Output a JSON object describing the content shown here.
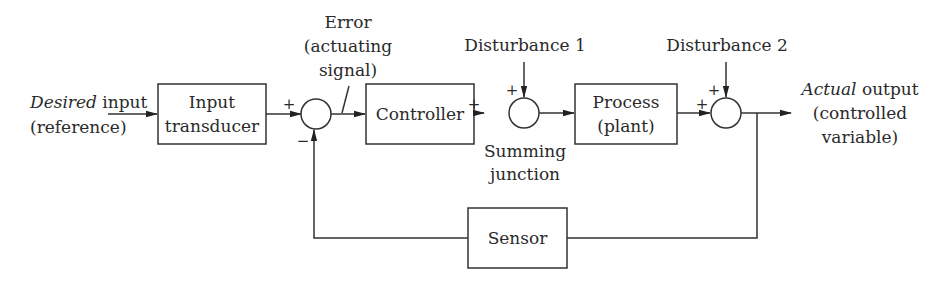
{
  "diagram": {
    "type": "feedback-control-block-diagram",
    "input_label": {
      "italic": "Desired",
      "rest": " input",
      "line2": "(reference)"
    },
    "output_label": {
      "italic": "Actual",
      "rest": " output",
      "line2": "(controlled",
      "line3": "variable)"
    },
    "error_label": {
      "line1": "Error",
      "line2": "(actuating",
      "line3": "signal)"
    },
    "disturbance1": "Disturbance 1",
    "disturbance2": "Disturbance 2",
    "summing_junction_label": {
      "line1": "Summing",
      "line2": "junction"
    },
    "blocks": [
      {
        "id": "input-transducer",
        "line1": "Input",
        "line2": "transducer"
      },
      {
        "id": "controller",
        "line1": "Controller"
      },
      {
        "id": "process",
        "line1": "Process",
        "line2": "(plant)"
      },
      {
        "id": "sensor",
        "line1": "Sensor"
      }
    ],
    "signs": {
      "junction1_plus": "+",
      "junction1_minus": "−",
      "junction2_left_plus": "+",
      "junction2_top_plus": "+",
      "junction3_left_plus": "+",
      "junction3_top_plus": "+"
    },
    "edges": [
      {
        "from": "desired-input",
        "to": "input-transducer"
      },
      {
        "from": "input-transducer",
        "to": "summing-junction-1",
        "sign": "+"
      },
      {
        "from": "summing-junction-1",
        "to": "controller",
        "label": "Error (actuating signal)"
      },
      {
        "from": "controller",
        "to": "summing-junction-2",
        "sign": "+"
      },
      {
        "from": "disturbance-1",
        "to": "summing-junction-2",
        "sign": "+"
      },
      {
        "from": "summing-junction-2",
        "to": "process"
      },
      {
        "from": "process",
        "to": "summing-junction-3",
        "sign": "+"
      },
      {
        "from": "disturbance-2",
        "to": "summing-junction-3",
        "sign": "+"
      },
      {
        "from": "summing-junction-3",
        "to": "actual-output"
      },
      {
        "from": "summing-junction-3",
        "to": "sensor"
      },
      {
        "from": "sensor",
        "to": "summing-junction-1",
        "sign": "−"
      }
    ]
  }
}
